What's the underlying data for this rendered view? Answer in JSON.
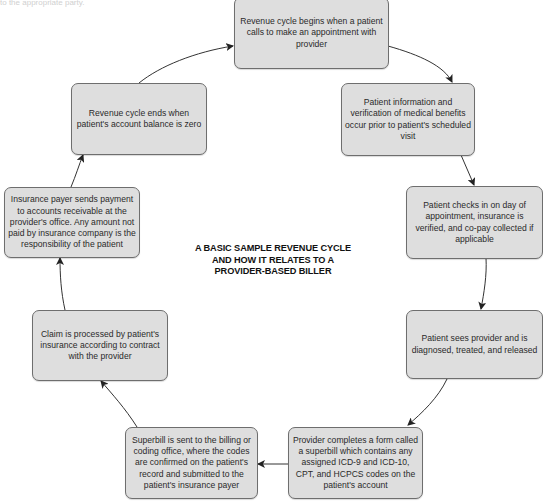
{
  "caption_fragment": "to the appropriate party.",
  "diagram": {
    "title_lines": [
      "A BASIC SAMPLE REVENUE CYCLE",
      "AND HOW IT RELATES TO A",
      "PROVIDER-BASED BILLER"
    ],
    "steps": [
      {
        "id": "step-1",
        "text": "Revenue cycle begins when a patient calls to make an appointment with provider"
      },
      {
        "id": "step-2",
        "text": "Patient information and verification of medical benefits occur prior to patient's scheduled visit"
      },
      {
        "id": "step-3",
        "text": "Patient checks in on day of appointment, insurance is verified, and co-pay collected if applicable"
      },
      {
        "id": "step-4",
        "text": "Patient sees provider and is diagnosed, treated, and released"
      },
      {
        "id": "step-5",
        "text": "Provider completes a form called a superbill which contains any assigned ICD-9 and ICD-10, CPT, and HCPCS codes on the patient's account"
      },
      {
        "id": "step-6",
        "text": "Superbill is sent to the billing or coding office, where the codes are confirmed on the patient's record and submitted to the patient's insurance payer"
      },
      {
        "id": "step-7",
        "text": "Claim is processed by patient's insurance according to contract with the provider"
      },
      {
        "id": "step-8",
        "text": "Insurance payer sends payment to accounts receivable at the provider's office. Any amount not paid by insurance company is the responsibility of the patient"
      },
      {
        "id": "step-9",
        "text": "Revenue cycle ends when patient's account balance is zero"
      }
    ],
    "colors": {
      "box_fill": "#dedede",
      "box_border": "#6e6e6e",
      "arrow": "#333333",
      "text": "#2a2a2a"
    }
  }
}
